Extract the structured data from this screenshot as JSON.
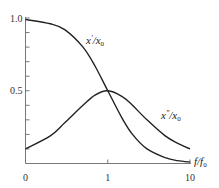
{
  "chart_data": {
    "type": "line",
    "title": "",
    "xlabel": "f/f0",
    "ylabel": "",
    "x_scale": "log",
    "x_ticks": [
      {
        "value": 0.1,
        "label": "0"
      },
      {
        "value": 1,
        "label": "1"
      },
      {
        "value": 10,
        "label": "10"
      }
    ],
    "y_ticks": [
      {
        "value": 0.5,
        "label": "0.5"
      },
      {
        "value": 1.0,
        "label": "1.0"
      }
    ],
    "y_minor_step": 0.1,
    "ylim": [
      0,
      1.0
    ],
    "xlim": [
      0.1,
      10
    ],
    "grid": false,
    "legend": "inline labels",
    "x": [
      0.1,
      0.2,
      0.3,
      0.5,
      0.7,
      1.0,
      1.5,
      2,
      3,
      5,
      7,
      10
    ],
    "series": [
      {
        "name": "x'/x0",
        "values": [
          0.99,
          0.96,
          0.92,
          0.8,
          0.67,
          0.5,
          0.31,
          0.2,
          0.1,
          0.04,
          0.02,
          0.01
        ]
      },
      {
        "name": "x''/x0",
        "values": [
          0.1,
          0.19,
          0.28,
          0.4,
          0.47,
          0.5,
          0.46,
          0.4,
          0.3,
          0.19,
          0.14,
          0.1
        ]
      }
    ],
    "annotations": [
      {
        "text": "x'/x0",
        "near": "upper curve, around f/f0 ≈ 0.7"
      },
      {
        "text": "x''/x0",
        "near": "lower curve, around f/f0 ≈ 4"
      }
    ]
  },
  "labels": {
    "xaxis_label": "f/f",
    "xaxis_label_sub": "0",
    "series1_main": "x",
    "series1_prime": "′",
    "series1_den": "/x",
    "series1_sub": "0",
    "series2_main": "x",
    "series2_prime": "″",
    "series2_den": "/x",
    "series2_sub": "0"
  },
  "colors": {
    "axis": "#666666",
    "curve": "#222222",
    "background": "#ffffff"
  }
}
